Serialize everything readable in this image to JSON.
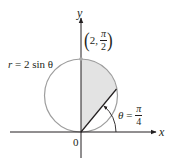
{
  "diagram": {
    "type": "polar-region",
    "axes": {
      "x_label": "x",
      "y_label": "y",
      "origin_label": "0"
    },
    "curve": {
      "equation_lhs": "r",
      "equation_eq": "=",
      "equation_rhs": "2 sin θ"
    },
    "point": {
      "open": "(",
      "r_value": "2,",
      "theta_num": "π",
      "theta_den": "2",
      "close": ")"
    },
    "angle": {
      "var": "θ",
      "eq": "=",
      "num": "π",
      "den": "4"
    },
    "shaded_region": "area inside r = 2 sin θ between θ = π/4 and θ = π/2",
    "colors": {
      "axis": "#231f20",
      "circle": "#9d9d9d",
      "shade": "#e3e3e3",
      "ray": "#231f20",
      "point": "#a8a8a8"
    }
  }
}
